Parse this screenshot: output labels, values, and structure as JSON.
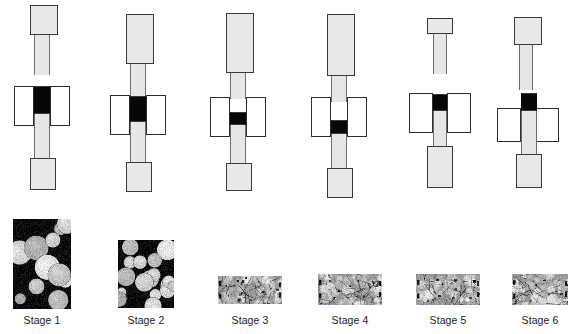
{
  "figure": {
    "width": 573,
    "height": 334,
    "background_color": "#ffffff",
    "colors": {
      "part_fill": "#e8e8e8",
      "part_stroke": "#3a3a3a",
      "die_fill": "#ffffff",
      "die_stroke": "#2e2e2e",
      "powder_black": "#070707",
      "label_text": "#1a1a1a"
    }
  },
  "stages": [
    {
      "id": "stage-1",
      "label": "Stage 1",
      "column_left": 0,
      "column_width": 100,
      "punch_top": {
        "x": 30,
        "y": 5,
        "w": 28,
        "h": 30
      },
      "upper_stem": {
        "x": 34,
        "y": 33,
        "w": 16,
        "h": 42
      },
      "die_left": {
        "x": 14,
        "y": 86,
        "w": 20,
        "h": 40
      },
      "die_right": {
        "x": 50,
        "y": 86,
        "w": 20,
        "h": 40
      },
      "powder_zone": {
        "x": 34,
        "y": 86,
        "w": 16,
        "h": 28
      },
      "lower_stem": {
        "x": 34,
        "y": 114,
        "w": 16,
        "h": 46
      },
      "punch_bottom": {
        "x": 30,
        "y": 158,
        "w": 26,
        "h": 32
      }
    },
    {
      "id": "stage-2",
      "label": "Stage 2",
      "column_left": 100,
      "column_width": 100,
      "punch_top": {
        "x": 26,
        "y": 14,
        "w": 28,
        "h": 50
      },
      "upper_stem": {
        "x": 30,
        "y": 62,
        "w": 16,
        "h": 34
      },
      "die_left": {
        "x": 10,
        "y": 95,
        "w": 20,
        "h": 40
      },
      "die_right": {
        "x": 46,
        "y": 95,
        "w": 20,
        "h": 40
      },
      "powder_zone": {
        "x": 30,
        "y": 96,
        "w": 16,
        "h": 26
      },
      "lower_stem": {
        "x": 30,
        "y": 122,
        "w": 16,
        "h": 42
      },
      "punch_bottom": {
        "x": 26,
        "y": 162,
        "w": 26,
        "h": 30
      }
    },
    {
      "id": "stage-3",
      "label": "Stage 3",
      "column_left": 200,
      "column_width": 100,
      "punch_top": {
        "x": 26,
        "y": 13,
        "w": 28,
        "h": 60
      },
      "upper_stem": {
        "x": 30,
        "y": 71,
        "w": 16,
        "h": 28
      },
      "die_left": {
        "x": 10,
        "y": 97,
        "w": 20,
        "h": 40
      },
      "die_right": {
        "x": 46,
        "y": 97,
        "w": 20,
        "h": 40
      },
      "powder_zone": {
        "x": 30,
        "y": 112,
        "w": 16,
        "h": 13
      },
      "lower_stem": {
        "x": 30,
        "y": 125,
        "w": 16,
        "h": 40
      },
      "punch_bottom": {
        "x": 26,
        "y": 163,
        "w": 26,
        "h": 28
      }
    },
    {
      "id": "stage-4",
      "label": "Stage 4",
      "column_left": 300,
      "column_width": 100,
      "punch_top": {
        "x": 27,
        "y": 14,
        "w": 28,
        "h": 62
      },
      "upper_stem": {
        "x": 31,
        "y": 74,
        "w": 16,
        "h": 28
      },
      "die_left": {
        "x": 11,
        "y": 97,
        "w": 20,
        "h": 40
      },
      "die_right": {
        "x": 47,
        "y": 97,
        "w": 20,
        "h": 40
      },
      "powder_zone": {
        "x": 31,
        "y": 120,
        "w": 16,
        "h": 14
      },
      "lower_stem": {
        "x": 31,
        "y": 134,
        "w": 16,
        "h": 36
      },
      "punch_bottom": {
        "x": 27,
        "y": 168,
        "w": 26,
        "h": 30
      }
    },
    {
      "id": "stage-5",
      "label": "Stage 5",
      "column_left": 400,
      "column_width": 90,
      "punch_top": {
        "x": 27,
        "y": 18,
        "w": 26,
        "h": 16
      },
      "upper_stem": {
        "x": 33,
        "y": 32,
        "w": 14,
        "h": 42
      },
      "die_left": {
        "x": 9,
        "y": 93,
        "w": 24,
        "h": 40
      },
      "die_right": {
        "x": 47,
        "y": 93,
        "w": 24,
        "h": 40
      },
      "powder_zone": {
        "x": 33,
        "y": 94,
        "w": 14,
        "h": 17
      },
      "lower_stem": {
        "x": 33,
        "y": 111,
        "w": 14,
        "h": 37
      },
      "punch_bottom": {
        "x": 27,
        "y": 146,
        "w": 26,
        "h": 42
      }
    },
    {
      "id": "stage-6",
      "label": "Stage 6",
      "column_left": 490,
      "column_width": 83,
      "punch_top": {
        "x": 24,
        "y": 17,
        "w": 28,
        "h": 28
      },
      "upper_stem": {
        "x": 29,
        "y": 43,
        "w": 14,
        "h": 47
      },
      "die_left": {
        "x": 7,
        "y": 108,
        "w": 24,
        "h": 34
      },
      "die_right": {
        "x": 45,
        "y": 108,
        "w": 24,
        "h": 34
      },
      "powder_zone": {
        "x": 31,
        "y": 93,
        "w": 16,
        "h": 18
      },
      "lower_stem": {
        "x": 31,
        "y": 111,
        "w": 16,
        "h": 45
      },
      "punch_bottom": {
        "x": 26,
        "y": 154,
        "w": 26,
        "h": 34
      }
    }
  ],
  "micrographs": [
    {
      "id": "micro-stage-1",
      "label": "Stage 1",
      "x": 13,
      "y": 219,
      "w": 58,
      "h": 90,
      "density": 0.44,
      "particle_radius": 10,
      "background": "#0a0a0a",
      "particle_color": "#c8c8c8",
      "description": "loose discrete spherical powder particles, large dark pore network"
    },
    {
      "id": "micro-stage-2",
      "label": "Stage 2",
      "x": 118,
      "y": 240,
      "w": 56,
      "h": 68,
      "density": 0.66,
      "particle_radius": 8,
      "background": "#0a0a0a",
      "particle_color": "#c8c8c8",
      "description": "partially densified, necks forming between particles"
    },
    {
      "id": "micro-stage-3",
      "label": "Stage 3",
      "x": 218,
      "y": 276,
      "w": 64,
      "h": 28,
      "density": 0.93,
      "particle_radius": 4,
      "background": "#9a9a9a",
      "particle_color": "#c2c2c2",
      "description": "thin dense layer, grains merged, few residual pores"
    },
    {
      "id": "micro-stage-4",
      "label": "Stage 4",
      "x": 318,
      "y": 274,
      "w": 64,
      "h": 31,
      "density": 0.94,
      "particle_radius": 4,
      "background": "#9a9a9a",
      "particle_color": "#c2c2c2",
      "description": "thin dense layer, grain boundaries visible"
    },
    {
      "id": "micro-stage-5",
      "label": "Stage 5",
      "x": 416,
      "y": 274,
      "w": 64,
      "h": 31,
      "density": 0.95,
      "particle_radius": 4,
      "background": "#9a9a9a",
      "particle_color": "#c4c4c4",
      "description": "fully dense thin compact"
    },
    {
      "id": "micro-stage-6",
      "label": "Stage 6",
      "x": 512,
      "y": 274,
      "w": 56,
      "h": 31,
      "density": 0.95,
      "particle_radius": 4,
      "background": "#9a9a9a",
      "particle_color": "#c4c4c4",
      "description": "fully dense thin compact"
    }
  ],
  "labels": {
    "row_y": 314,
    "font_size_px": 10.5
  }
}
